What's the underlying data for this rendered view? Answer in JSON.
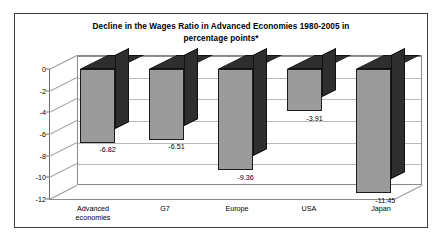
{
  "chart_data": {
    "type": "bar",
    "title": "Decline in the Wages Ratio in Advanced Economies 1980-2005 in percentage points*",
    "title_line1": "Decline in the Wages Ratio in Advanced Economies 1980-2005 in",
    "title_line2": "percentage points*",
    "xlabel": "",
    "ylabel": "",
    "categories": [
      "Advanced\neconomies",
      "G7",
      "Europe",
      "USA",
      "Japan"
    ],
    "values": [
      -6.82,
      -6.51,
      -9.36,
      -3.91,
      -11.45
    ],
    "value_labels": [
      "-6.82",
      "-6.51",
      "-9.36",
      "-3.91",
      "-11.45"
    ],
    "ylim": [
      -12,
      0
    ],
    "yticks": [
      0,
      -2,
      -4,
      -6,
      -8,
      -10,
      -12
    ],
    "ytick_labels": [
      "0",
      "-2",
      "-4",
      "-6",
      "-8",
      "-10",
      "-12"
    ],
    "grid": true,
    "legend": false,
    "style": "3d-column",
    "colors": {
      "bar_front": "#9b9b9b",
      "bar_shade": "#2e2e2e",
      "bar_outline": "#1c1c1c",
      "gridline": "#b9b9b9",
      "axis": "#6e6e6e",
      "frame": "#3d3d3d",
      "background": "#ffffff",
      "text": "#000000"
    }
  }
}
